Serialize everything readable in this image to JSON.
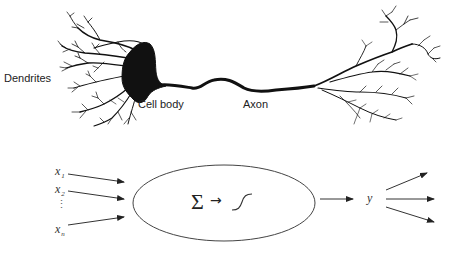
{
  "biological_neuron": {
    "labels": {
      "dendrites": "Dendrites",
      "cell_body": "Cell body",
      "axon": "Axon"
    }
  },
  "artificial_neuron": {
    "inputs": [
      {
        "symbol": "x",
        "subscript": "1"
      },
      {
        "symbol": "x",
        "subscript": "2"
      },
      {
        "symbol": "⋮",
        "subscript": ""
      },
      {
        "symbol": "x",
        "subscript": "n"
      }
    ],
    "node": {
      "sum_symbol": "Σ",
      "arrow_symbol": "→",
      "activation": "sigmoid-icon"
    },
    "output": {
      "symbol": "y",
      "output_arrow_count": 3
    }
  },
  "colors": {
    "ink": "#111111",
    "line": "#333333",
    "background": "#ffffff"
  }
}
